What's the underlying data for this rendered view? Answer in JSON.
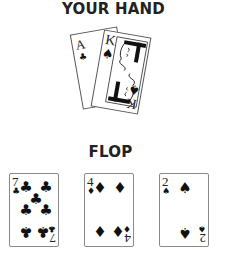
{
  "headings": {
    "hand": "YOUR HAND",
    "flop": "FLOP"
  },
  "hand": [
    {
      "rank": "A",
      "suit": "clubs",
      "symbol": "♣",
      "color": "#111111"
    },
    {
      "rank": "K",
      "suit": "spades",
      "symbol": "♠",
      "color": "#111111",
      "face": "king"
    }
  ],
  "flop": [
    {
      "rank": "7",
      "suit": "clubs",
      "symbol": "♣",
      "color": "#111111"
    },
    {
      "rank": "4",
      "suit": "diamonds",
      "symbol": "♦",
      "color": "#111111"
    },
    {
      "rank": "2",
      "suit": "spades",
      "symbol": "♠",
      "color": "#111111"
    }
  ]
}
